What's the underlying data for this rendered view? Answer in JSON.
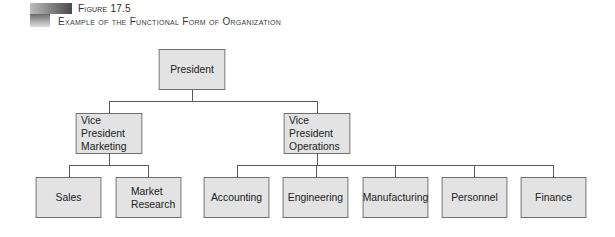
{
  "figure": {
    "label": "Figure 17.5",
    "title": "Example of the Functional Form of Organization"
  },
  "org_chart": {
    "president": {
      "label": "President"
    },
    "vp_marketing": {
      "label_line1": "Vice President",
      "label_line2": "Marketing"
    },
    "vp_operations": {
      "label_line1": "Vice President",
      "label_line2": "Operations"
    },
    "marketing_units": [
      {
        "label": "Sales"
      },
      {
        "label_line1": "Market",
        "label_line2": "Research"
      }
    ],
    "operations_units": [
      {
        "label": "Accounting"
      },
      {
        "label": "Engineering"
      },
      {
        "label": "Manufacturing"
      },
      {
        "label": "Personnel"
      },
      {
        "label": "Finance"
      }
    ]
  }
}
